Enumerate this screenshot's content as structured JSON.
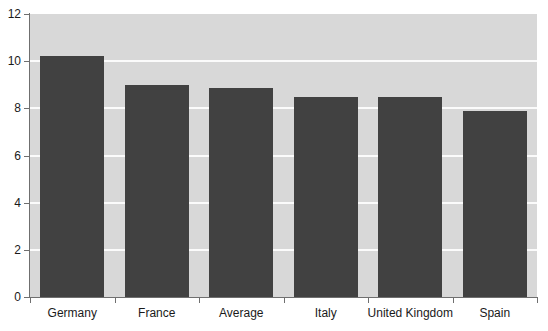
{
  "chart_data": {
    "type": "bar",
    "title": "",
    "subtitle": "",
    "xlabel": "",
    "ylabel": "",
    "categories": [
      "Germany",
      "France",
      "Average",
      "Italy",
      "United Kingdom",
      "Spain"
    ],
    "values": [
      10.2,
      9.0,
      8.85,
      8.5,
      8.5,
      7.9
    ],
    "series": [
      {
        "name": "",
        "values": [
          10.2,
          9.0,
          8.85,
          8.5,
          8.5,
          7.9
        ]
      }
    ],
    "ylim": [
      0,
      12
    ],
    "y_ticks": [
      0,
      2,
      4,
      6,
      8,
      10,
      12
    ],
    "y_tick_labels": [
      "0",
      "2",
      "4",
      "6",
      "8",
      "10",
      "12"
    ],
    "grid": true,
    "grid_axis": "y",
    "legend": false,
    "legend_position": "none",
    "annotations": []
  },
  "style": {
    "bar_color": "#414141",
    "plot_background": "#d8d8d8",
    "figure_background": "#ffffff",
    "gridline_color": "#fbfbfb",
    "axis_color": "#6f6f6f",
    "tick_label_color": "#1a1a1a"
  }
}
